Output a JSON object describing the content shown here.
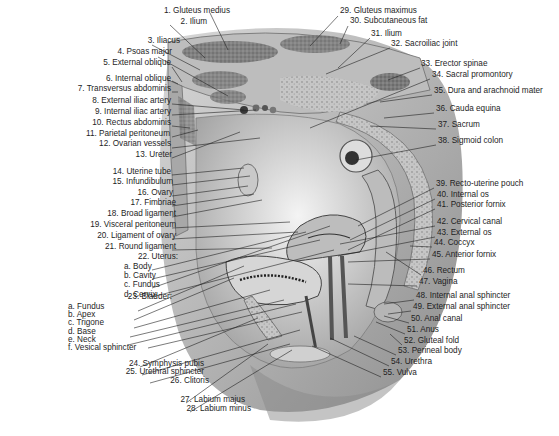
{
  "figure": {
    "type": "labeled anatomical illustration"
  },
  "labels_left": [
    {
      "text": "1.  Gluteus medius",
      "x": 168,
      "y": 12
    },
    {
      "text": "2.  Ilium",
      "x": 145,
      "y": 23
    },
    {
      "text": "3.  Iliacus",
      "x": 118,
      "y": 42
    },
    {
      "text": "4.  Psoas major",
      "x": 110,
      "y": 53
    },
    {
      "text": "5.  External oblique",
      "x": 109,
      "y": 64
    },
    {
      "text": "6.  Internal oblique",
      "x": 109,
      "y": 80
    },
    {
      "text": "7.  Transversus abdominis",
      "x": 109,
      "y": 90
    },
    {
      "text": "8.  External iliac artery",
      "x": 109,
      "y": 102
    },
    {
      "text": "9.  Internal iliac artery",
      "x": 109,
      "y": 113
    },
    {
      "text": "10.  Rectus abdominis",
      "x": 109,
      "y": 124
    },
    {
      "text": "11.  Parietal peritoneum",
      "x": 108,
      "y": 135
    },
    {
      "text": "12.  Ovarian vessels",
      "x": 109,
      "y": 145
    },
    {
      "text": "13.  Ureter",
      "x": 110,
      "y": 156
    },
    {
      "text": "14.  Uterine tube",
      "x": 109,
      "y": 173
    },
    {
      "text": "15.  Infundibulum",
      "x": 111,
      "y": 183
    },
    {
      "text": "16.  Ovary",
      "x": 111,
      "y": 194
    },
    {
      "text": "17.  Fimbriae",
      "x": 114,
      "y": 204
    },
    {
      "text": "18.  Broad ligament",
      "x": 114,
      "y": 215
    },
    {
      "text": "19.  Visceral peritoneum",
      "x": 114,
      "y": 226
    },
    {
      "text": "20.  Ligament of ovary",
      "x": 114,
      "y": 237
    },
    {
      "text": "21.  Round ligament",
      "x": 114,
      "y": 248
    }
  ],
  "uterus": {
    "heading": "22.  Uterus:",
    "x": 116,
    "y": 258,
    "parts": [
      "a.  Body",
      "b.  Cavity",
      "c.  Fundus",
      "d.  Cervix"
    ]
  },
  "bladder": {
    "heading": "23.  Bladder:",
    "x": 110,
    "y": 298,
    "parts": [
      "a.  Fundus",
      "b.  Apex",
      "c.  Trigone",
      "d.  Base",
      "e.  Neck",
      "f.  Vesical sphincter"
    ]
  },
  "labels_bottom_left": [
    {
      "text": "24.  Symphysis pubis",
      "x": 142,
      "y": 365
    },
    {
      "text": "25.  Urethral sphincter",
      "x": 142,
      "y": 373
    },
    {
      "text": "26.  Clitoris",
      "x": 147,
      "y": 382
    },
    {
      "text": "27.  Labium majus",
      "x": 183,
      "y": 401
    },
    {
      "text": "28.  Labium minus",
      "x": 189,
      "y": 410
    }
  ],
  "labels_right": [
    {
      "text": "29.  Gluteus maximus",
      "x": 340,
      "y": 12
    },
    {
      "text": "30.  Subcutaneous fat",
      "x": 350,
      "y": 22
    },
    {
      "text": "31.  Ilium",
      "x": 371,
      "y": 35
    },
    {
      "text": "32.  Sacroiliac joint",
      "x": 391,
      "y": 45
    },
    {
      "text": "33.  Erector spinae",
      "x": 421,
      "y": 65
    },
    {
      "text": "34.  Sacral promontory",
      "x": 432,
      "y": 76
    },
    {
      "text": "35.  Dura and arachnoid mater",
      "x": 434,
      "y": 92
    },
    {
      "text": "36.  Cauda equina",
      "x": 436,
      "y": 110
    },
    {
      "text": "37.  Sacrum",
      "x": 438,
      "y": 126
    },
    {
      "text": "38.  Sigmoid colon",
      "x": 438,
      "y": 142
    },
    {
      "text": "39.  Recto-uterine pouch",
      "x": 436,
      "y": 185
    },
    {
      "text": "40.  Internal os",
      "x": 437,
      "y": 196
    },
    {
      "text": "41.  Posterior fornix",
      "x": 437,
      "y": 206
    },
    {
      "text": "42.  Cervical canal",
      "x": 437,
      "y": 223
    },
    {
      "text": "43.  External os",
      "x": 437,
      "y": 234
    },
    {
      "text": "44.  Coccyx",
      "x": 434,
      "y": 244
    },
    {
      "text": "45.  Anterior fornix",
      "x": 432,
      "y": 256
    },
    {
      "text": "46.  Rectum",
      "x": 423,
      "y": 272
    },
    {
      "text": "47.  Vagina",
      "x": 419,
      "y": 283
    },
    {
      "text": "48.  Internal anal sphincter",
      "x": 416,
      "y": 297
    },
    {
      "text": "49.  External anal sphincter",
      "x": 413,
      "y": 308
    },
    {
      "text": "50.  Anal canal",
      "x": 411,
      "y": 320
    },
    {
      "text": "51.  Anus",
      "x": 407,
      "y": 331
    },
    {
      "text": "52.  Gluteal fold",
      "x": 404,
      "y": 342
    },
    {
      "text": "53.  Perineal body",
      "x": 398,
      "y": 352
    },
    {
      "text": "54.  Urethra",
      "x": 391,
      "y": 363
    },
    {
      "text": "55.  Vulva",
      "x": 383,
      "y": 374
    }
  ]
}
